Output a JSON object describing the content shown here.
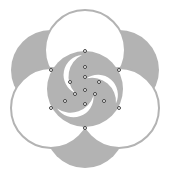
{
  "diagram": {
    "type": "geometric-construction",
    "colors": {
      "fill_gray": "#b3b3b3",
      "circle_stroke": "#b3b3b3",
      "background": "#ffffff",
      "point_stroke": "#333333",
      "point_fill": "#ffffff"
    },
    "center": [
      85,
      89
    ],
    "gray_lobes": [
      {
        "cx": 85,
        "cy": 128,
        "r": 40
      },
      {
        "cx": 51,
        "cy": 70,
        "r": 40
      },
      {
        "cx": 119,
        "cy": 70,
        "r": 40
      }
    ],
    "white_circles": [
      {
        "cx": 85,
        "cy": 50,
        "r": 40
      },
      {
        "cx": 51,
        "cy": 108,
        "r": 40
      },
      {
        "cx": 119,
        "cy": 108,
        "r": 40
      }
    ],
    "inner_circle": {
      "cx": 85,
      "cy": 89,
      "r": 38
    },
    "crescent_rotations": [
      0,
      120,
      240
    ],
    "points": [
      [
        85,
        51
      ],
      [
        51,
        70
      ],
      [
        119,
        70
      ],
      [
        85,
        67
      ],
      [
        85,
        77
      ],
      [
        70,
        82
      ],
      [
        99,
        82
      ],
      [
        85,
        90
      ],
      [
        75,
        94
      ],
      [
        95,
        94
      ],
      [
        65,
        101
      ],
      [
        104,
        101
      ],
      [
        85,
        104
      ],
      [
        51,
        108
      ],
      [
        119,
        108
      ],
      [
        85,
        128
      ]
    ]
  }
}
